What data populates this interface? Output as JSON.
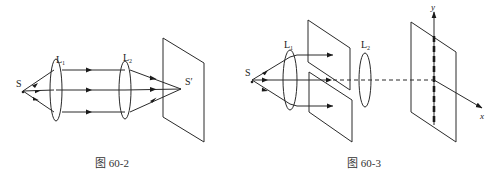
{
  "figure_2": {
    "caption": "图 60-2",
    "source_label": "S",
    "lens1_label": "L",
    "lens1_sub": "1",
    "lens2_label": "L",
    "lens2_sub": "2",
    "image_label": "S′"
  },
  "figure_3": {
    "caption": "图 60-3",
    "source_label": "S",
    "lens1_label": "L",
    "lens1_sub": "1",
    "lens2_label": "L",
    "lens2_sub": "2",
    "y_axis_label": "y",
    "x_axis_label": "x"
  },
  "colors": {
    "line": "#2a2a2a",
    "background": "#ffffff"
  }
}
